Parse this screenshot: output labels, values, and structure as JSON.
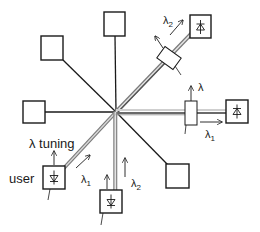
{
  "diagram": {
    "type": "wavelength-routed star network",
    "center": {
      "x": 116,
      "y": 112
    },
    "colors": {
      "line": "#1a1a1a",
      "fiber_light": "#d8d8d8",
      "fiber_dark": "#7a7a7a",
      "box_fill": "#ffffff"
    },
    "labels": {
      "user": "user",
      "lambda_tuning": "λ tuning",
      "lambda": "λ",
      "lambda1": "λ",
      "lambda1_sub": "1",
      "lambda2": "λ",
      "lambda2_sub": "2"
    },
    "nodes": [
      {
        "id": "top",
        "kind": "terminal"
      },
      {
        "id": "top-left",
        "kind": "terminal"
      },
      {
        "id": "left",
        "kind": "terminal"
      },
      {
        "id": "bottom-right",
        "kind": "terminal"
      },
      {
        "id": "top-right",
        "kind": "photodiode-receiver"
      },
      {
        "id": "right",
        "kind": "photodiode-receiver"
      },
      {
        "id": "bottom",
        "kind": "photodiode-transmitter"
      },
      {
        "id": "user",
        "kind": "photodiode-transmitter"
      }
    ],
    "filters": [
      {
        "id": "filter-top-right",
        "on": "top-right"
      },
      {
        "id": "filter-right",
        "on": "right"
      }
    ]
  }
}
